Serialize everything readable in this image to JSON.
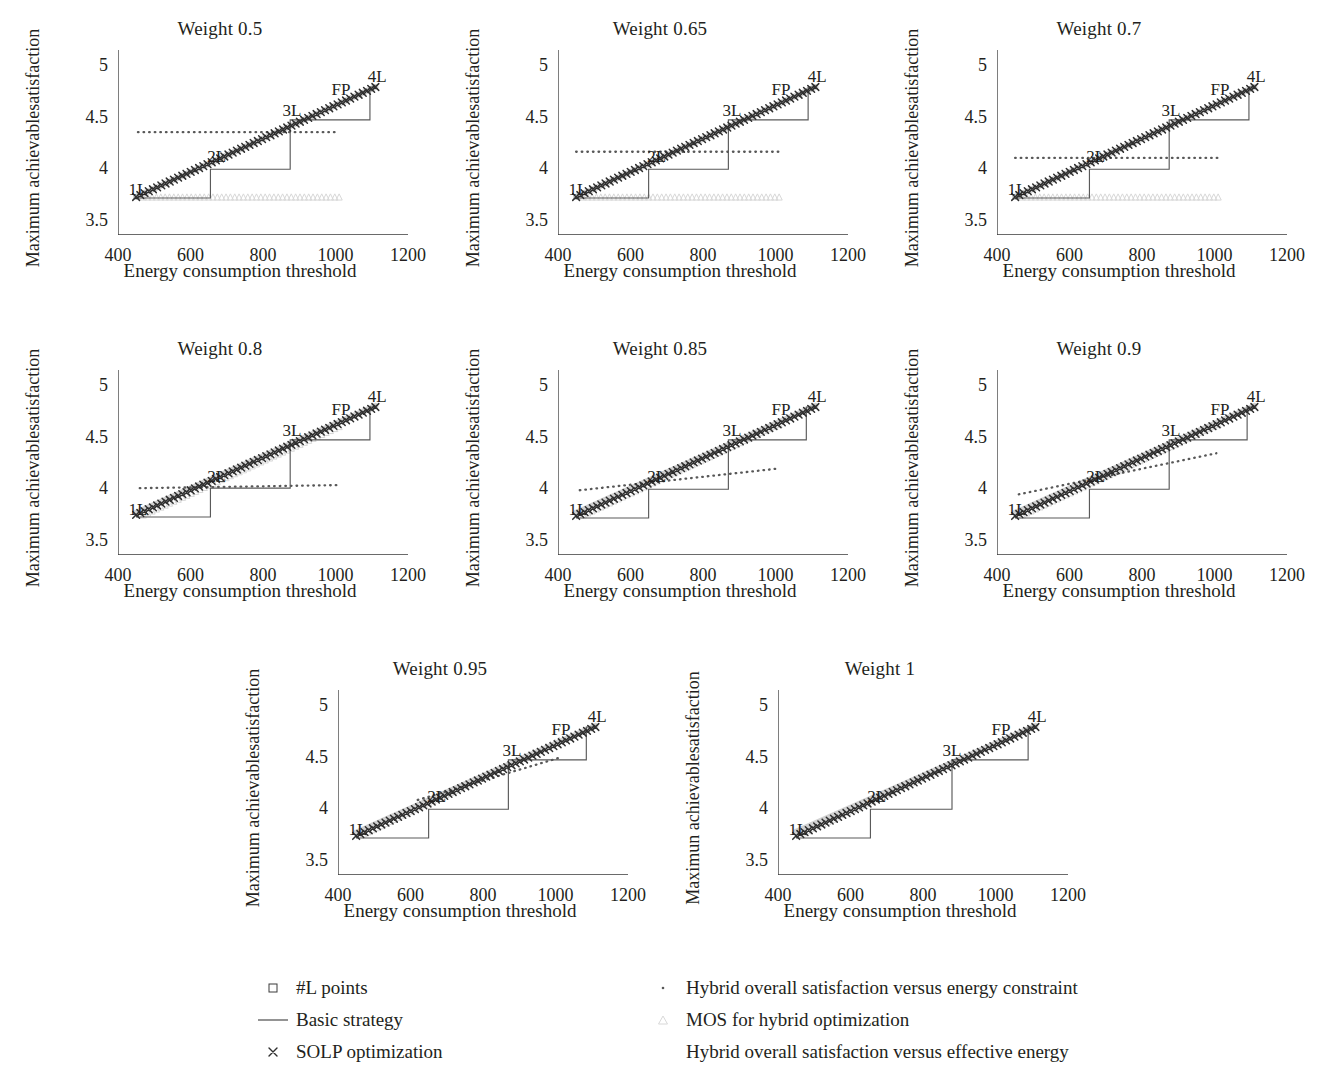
{
  "figure": {
    "xlabel": "Energy consumption threshold",
    "ylabel": "Maximum achievable satisfaction",
    "ylabel_line1": "Maximum achievable",
    "ylabel_line2": "satisfaction",
    "ylabel_line1_alt": "Maximun achievable",
    "xticks": [
      "400",
      "600",
      "800",
      "1000",
      "1200"
    ],
    "yticks": [
      "3.5",
      "4",
      "4.5",
      "5"
    ],
    "point_labels": [
      "1L",
      "2L",
      "3L",
      "4L",
      "FP"
    ]
  },
  "legend": {
    "items": [
      {
        "marker": "square-marker",
        "label": "#L points"
      },
      {
        "marker": "line-marker",
        "label": "Basic strategy"
      },
      {
        "marker": "cross-marker",
        "label": "SOLP optimization"
      },
      {
        "marker": "dot-marker",
        "label": "Hybrid overall satisfaction versus energy constraint"
      },
      {
        "marker": "triangle-marker",
        "label": "MOS for hybrid optimization"
      },
      {
        "marker": "none",
        "label": "Hybrid overall satisfaction versus effective energy"
      }
    ]
  },
  "colors": {
    "axis": "#3a3a3a",
    "solp": "#2f2f2f",
    "basic": "#5a5a5a",
    "hybrid_dotted": "#585858",
    "mos": "#d8d8d8",
    "effective": "#cccccc",
    "text": "#231f20"
  },
  "chart_data": {
    "type": "line",
    "xlabel": "Energy consumption threshold",
    "ylabel": "Maximum achievable satisfaction",
    "xlim": [
      400,
      1200
    ],
    "ylim": [
      3.35,
      5.15
    ],
    "xticks": [
      400,
      600,
      800,
      1000,
      1200
    ],
    "yticks": [
      3.5,
      4,
      4.5,
      5
    ],
    "grid": false,
    "legend_position": "below-figure",
    "series_names": [
      "#L points",
      "Basic strategy",
      "SOLP optimization",
      "Hybrid overall satisfaction versus energy constraint",
      "MOS for hybrid optimization",
      "Hybrid overall satisfaction versus effective energy"
    ],
    "annotations": [
      {
        "text": "1L",
        "x": 455,
        "y": 3.8
      },
      {
        "text": "2L",
        "x": 672,
        "y": 4.12
      },
      {
        "text": "3L",
        "x": 880,
        "y": 4.57
      },
      {
        "text": "4L",
        "x": 1115,
        "y": 4.9
      },
      {
        "text": "FP",
        "x": 1015,
        "y": 4.77
      }
    ],
    "panels": [
      {
        "title": "Weight 0.5",
        "weight": 0.5,
        "row": 0,
        "col": 0,
        "ylabel_text": "Maximum achievable satisfaction",
        "solp": {
          "x": [
            450,
            1110
          ],
          "y": [
            3.72,
            4.79
          ]
        },
        "basic_steps": [
          {
            "x0": 450,
            "x1": 655,
            "y": 3.71
          },
          {
            "x0": 655,
            "x1": 875,
            "y": 3.99
          },
          {
            "x0": 875,
            "x1": 1095,
            "y": 4.47
          },
          {
            "x0": 1095,
            "x1": 1110,
            "y": 4.79
          }
        ],
        "hybrid_dotted": {
          "x": [
            455,
            1010
          ],
          "y": [
            4.35,
            4.35
          ]
        },
        "mos": {
          "x": [
            470,
            1010
          ],
          "y": [
            3.72,
            3.72
          ]
        },
        "effective": {
          "x": [
            450,
            1110
          ],
          "y": [
            3.72,
            4.79
          ]
        }
      },
      {
        "title": "Weight 0.65",
        "weight": 0.65,
        "row": 0,
        "col": 1,
        "ylabel_text": "Maximum achievable satisfaction",
        "solp": {
          "x": [
            450,
            1110
          ],
          "y": [
            3.72,
            4.79
          ]
        },
        "basic_steps": [
          {
            "x0": 450,
            "x1": 650,
            "y": 3.71
          },
          {
            "x0": 650,
            "x1": 870,
            "y": 3.99
          },
          {
            "x0": 870,
            "x1": 1090,
            "y": 4.47
          },
          {
            "x0": 1090,
            "x1": 1110,
            "y": 4.79
          }
        ],
        "hybrid_dotted": {
          "x": [
            450,
            1010
          ],
          "y": [
            4.16,
            4.16
          ]
        },
        "mos": {
          "x": [
            470,
            1010
          ],
          "y": [
            3.72,
            3.72
          ]
        },
        "effective": {
          "x": [
            450,
            1110
          ],
          "y": [
            3.72,
            4.79
          ]
        }
      },
      {
        "title": "Weight 0.7",
        "weight": 0.7,
        "row": 0,
        "col": 2,
        "ylabel_text": "Maximum achievable satisfaction",
        "solp": {
          "x": [
            450,
            1110
          ],
          "y": [
            3.72,
            4.79
          ]
        },
        "basic_steps": [
          {
            "x0": 450,
            "x1": 655,
            "y": 3.71
          },
          {
            "x0": 655,
            "x1": 875,
            "y": 3.99
          },
          {
            "x0": 875,
            "x1": 1095,
            "y": 4.47
          },
          {
            "x0": 1095,
            "x1": 1110,
            "y": 4.79
          }
        ],
        "hybrid_dotted": {
          "x": [
            450,
            1010
          ],
          "y": [
            4.1,
            4.1
          ]
        },
        "mos": {
          "x": [
            470,
            1010
          ],
          "y": [
            3.72,
            3.72
          ]
        },
        "effective": {
          "x": [
            450,
            1110
          ],
          "y": [
            3.72,
            4.79
          ]
        }
      },
      {
        "title": "Weight 0.8",
        "weight": 0.8,
        "row": 1,
        "col": 0,
        "ylabel_text": "Maximum achievable satisfaction",
        "solp": {
          "x": [
            450,
            1110
          ],
          "y": [
            3.74,
            4.79
          ]
        },
        "basic_steps": [
          {
            "x0": 450,
            "x1": 655,
            "y": 3.72
          },
          {
            "x0": 655,
            "x1": 875,
            "y": 4.0
          },
          {
            "x0": 875,
            "x1": 1095,
            "y": 4.47
          },
          {
            "x0": 1095,
            "x1": 1110,
            "y": 4.79
          }
        ],
        "hybrid_dotted": {
          "x": [
            460,
            1010
          ],
          "y": [
            4.0,
            4.03
          ]
        },
        "mos": {
          "x": [
            470,
            1010
          ],
          "y": [
            3.74,
            4.6
          ]
        },
        "effective": {
          "x": [
            450,
            1110
          ],
          "y": [
            3.76,
            4.8
          ]
        }
      },
      {
        "title": "Weight 0.85",
        "weight": 0.85,
        "row": 1,
        "col": 1,
        "ylabel_text": "Maximum achievable satisfaction",
        "solp": {
          "x": [
            450,
            1110
          ],
          "y": [
            3.73,
            4.79
          ]
        },
        "basic_steps": [
          {
            "x0": 450,
            "x1": 650,
            "y": 3.71
          },
          {
            "x0": 650,
            "x1": 870,
            "y": 3.99
          },
          {
            "x0": 870,
            "x1": 1085,
            "y": 4.47
          },
          {
            "x0": 1085,
            "x1": 1110,
            "y": 4.79
          }
        ],
        "hybrid_dotted": {
          "x": [
            460,
            1005
          ],
          "y": [
            3.98,
            4.19
          ]
        },
        "mos": {
          "x": [
            470,
            1010
          ],
          "y": [
            3.74,
            4.62
          ]
        },
        "effective": {
          "x": [
            450,
            1110
          ],
          "y": [
            3.76,
            4.8
          ]
        }
      },
      {
        "title": "Weight 0.9",
        "weight": 0.9,
        "row": 1,
        "col": 2,
        "ylabel_text": "Maximum achievable satisfaction",
        "solp": {
          "x": [
            450,
            1110
          ],
          "y": [
            3.73,
            4.79
          ]
        },
        "basic_steps": [
          {
            "x0": 450,
            "x1": 655,
            "y": 3.71
          },
          {
            "x0": 655,
            "x1": 875,
            "y": 3.99
          },
          {
            "x0": 875,
            "x1": 1090,
            "y": 4.47
          },
          {
            "x0": 1090,
            "x1": 1110,
            "y": 4.79
          }
        ],
        "hybrid_dotted": {
          "x": [
            460,
            1005
          ],
          "y": [
            3.94,
            4.34
          ]
        },
        "mos": {
          "x": [
            470,
            1010
          ],
          "y": [
            3.74,
            4.62
          ]
        },
        "effective": {
          "x": [
            450,
            1110
          ],
          "y": [
            3.76,
            4.8
          ]
        }
      },
      {
        "title": "Weight 0.95",
        "weight": 0.95,
        "row": 2,
        "col": 0,
        "ylabel_text": "Maximum achievable satisfaction",
        "solp": {
          "x": [
            450,
            1110
          ],
          "y": [
            3.73,
            4.79
          ]
        },
        "basic_steps": [
          {
            "x0": 450,
            "x1": 650,
            "y": 3.71
          },
          {
            "x0": 650,
            "x1": 870,
            "y": 3.99
          },
          {
            "x0": 870,
            "x1": 1085,
            "y": 4.47
          },
          {
            "x0": 1085,
            "x1": 1110,
            "y": 4.79
          }
        ],
        "hybrid_dotted": {
          "x": [
            620,
            1010
          ],
          "y": [
            4.08,
            4.49
          ]
        },
        "mos": {
          "x": [
            470,
            1010
          ],
          "y": [
            3.75,
            4.66
          ]
        },
        "effective": {
          "x": [
            450,
            1110
          ],
          "y": [
            3.76,
            4.8
          ]
        }
      },
      {
        "title": "Weight 1",
        "weight": 1,
        "row": 2,
        "col": 1,
        "ylabel_text": "Maximun achievable satisfaction",
        "solp": {
          "x": [
            450,
            1110
          ],
          "y": [
            3.73,
            4.79
          ]
        },
        "basic_steps": [
          {
            "x0": 450,
            "x1": 655,
            "y": 3.71
          },
          {
            "x0": 655,
            "x1": 880,
            "y": 3.99
          },
          {
            "x0": 880,
            "x1": 1090,
            "y": 4.47
          },
          {
            "x0": 1090,
            "x1": 1110,
            "y": 4.79
          }
        ],
        "hybrid_dotted": null,
        "mos": {
          "x": [
            470,
            1080
          ],
          "y": [
            3.76,
            4.76
          ]
        },
        "effective": {
          "x": [
            450,
            1110
          ],
          "y": [
            3.77,
            4.8
          ]
        }
      }
    ]
  }
}
